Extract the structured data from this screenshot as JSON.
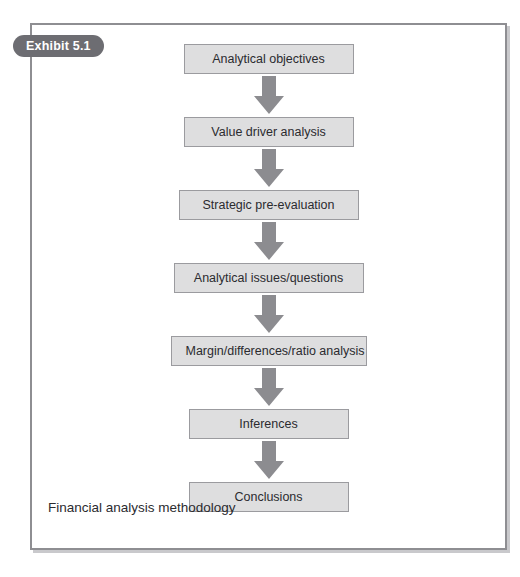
{
  "exhibit": {
    "badge_label": "Exhibit 5.1",
    "caption": "Financial analysis methodology",
    "frame_border_color": "#8e8e92",
    "badge_color": "#6d6d72",
    "box_fill_color": "#dededf",
    "box_border_color": "#9b9b9f",
    "arrow_color": "#8c8c90"
  },
  "flow": {
    "steps": [
      {
        "label": "Analytical objectives",
        "width": 170
      },
      {
        "label": "Value driver analysis",
        "width": 170
      },
      {
        "label": "Strategic pre-evaluation",
        "width": 180
      },
      {
        "label": "Analytical issues/questions",
        "width": 190
      },
      {
        "label": "Margin/differences/ratio analysis",
        "width": 196
      },
      {
        "label": "Inferences",
        "width": 160
      },
      {
        "label": "Conclusions",
        "width": 160
      }
    ],
    "arrow_count": 6,
    "arrow_direction": "down"
  }
}
